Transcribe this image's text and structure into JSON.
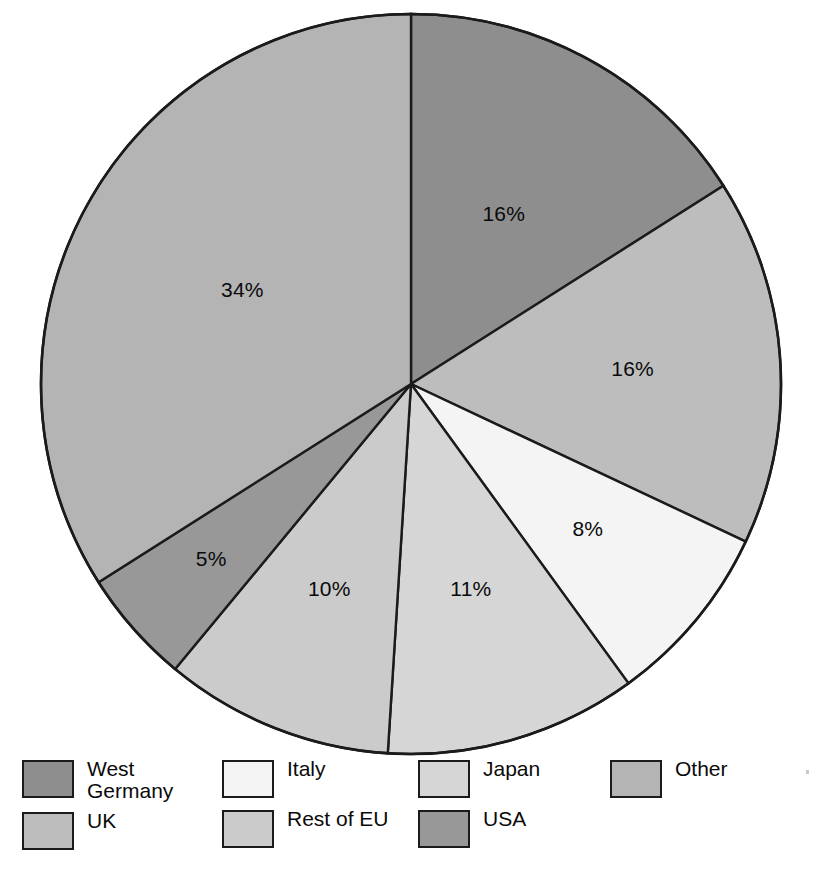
{
  "chart_data": {
    "type": "pie",
    "title": "",
    "subtitle": "",
    "xlabel": "",
    "ylabel": "",
    "grid": false,
    "legend_position": "bottom",
    "start_angle_deg": 0,
    "direction": "clockwise",
    "units": "percent",
    "total": 100,
    "categories": [
      "West Germany",
      "UK",
      "Italy",
      "Japan",
      "Rest of EU",
      "USA",
      "Other"
    ],
    "values": [
      16,
      16,
      8,
      11,
      10,
      5,
      34
    ],
    "labels": [
      "16%",
      "16%",
      "8%",
      "11%",
      "10%",
      "5%",
      "34%"
    ],
    "colors": [
      "#8e8e8e",
      "#bdbdbd",
      "#f4f4f4",
      "#d6d6d6",
      "#cbcbcb",
      "#989898",
      "#b4b4b4"
    ],
    "slices": [
      {
        "name": "West Germany",
        "value": 16,
        "label": "16%",
        "color": "#8e8e8e"
      },
      {
        "name": "UK",
        "value": 16,
        "label": "16%",
        "color": "#bdbdbd"
      },
      {
        "name": "Italy",
        "value": 8,
        "label": "8%",
        "color": "#f4f4f4"
      },
      {
        "name": "Japan",
        "value": 11,
        "label": "11%",
        "color": "#d6d6d6"
      },
      {
        "name": "Rest of EU",
        "value": 10,
        "label": "10%",
        "color": "#cbcbcb"
      },
      {
        "name": "USA",
        "value": 5,
        "label": "5%",
        "color": "#989898"
      },
      {
        "name": "Other",
        "value": 34,
        "label": "34%",
        "color": "#b4b4b4"
      }
    ]
  },
  "pie": {
    "center_x": 411,
    "center_y": 384,
    "radius": 370,
    "outline_color": "#1b1b1b"
  },
  "legend": {
    "columns": [
      {
        "entries": [
          {
            "label": "West\nGermany",
            "color": "#8e8e8e",
            "name": "west-germany"
          },
          {
            "label": "UK",
            "color": "#bdbdbd",
            "name": "uk"
          }
        ]
      },
      {
        "entries": [
          {
            "label": "Italy",
            "color": "#f4f4f4",
            "name": "italy"
          },
          {
            "label": "Rest of EU",
            "color": "#cbcbcb",
            "name": "rest-of-eu"
          }
        ]
      },
      {
        "entries": [
          {
            "label": "Japan",
            "color": "#d6d6d6",
            "name": "japan"
          },
          {
            "label": "USA",
            "color": "#989898",
            "name": "usa"
          }
        ]
      },
      {
        "entries": [
          {
            "label": "Other",
            "color": "#b4b4b4",
            "name": "other"
          }
        ]
      }
    ]
  }
}
